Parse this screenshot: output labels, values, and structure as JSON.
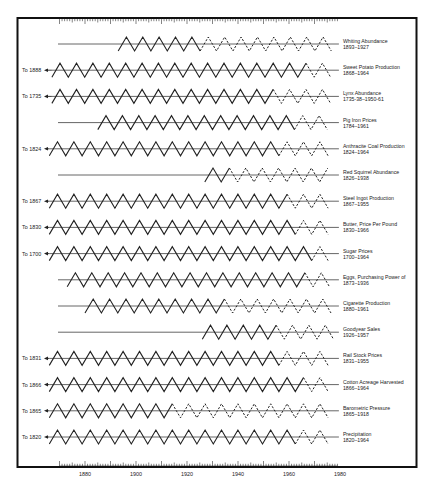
{
  "chart_data": {
    "type": "line",
    "title": "",
    "xlabel": "",
    "ylabel": "",
    "xlim": [
      1860,
      1985
    ],
    "x_ticks": [
      1880,
      1900,
      1920,
      1940,
      1960,
      1980
    ],
    "grid": false,
    "legend": "none",
    "series": [
      {
        "name": "Whiting Abundance",
        "range": "1893–1927",
        "to_label": "",
        "start_year": 1878,
        "zig_start_year": 1893,
        "dash_start_year": 1927,
        "end_year": 1978
      },
      {
        "name": "Sweet Potato Production",
        "range": "1868–1964",
        "to_label": "To 1888",
        "start_year": 1867,
        "zig_start_year": 1867,
        "dash_start_year": 1967,
        "end_year": 1978
      },
      {
        "name": "Lynx Abundance",
        "range": "1735-38–1950-61",
        "to_label": "To 1735",
        "start_year": 1867,
        "zig_start_year": 1867,
        "dash_start_year": 1957,
        "end_year": 1978
      },
      {
        "name": "Pig Iron Prices",
        "range": "1784–1961",
        "to_label": "",
        "start_year": 1878,
        "zig_start_year": 1885,
        "dash_start_year": 1965,
        "end_year": 1978
      },
      {
        "name": "Anthracite Coal Production",
        "range": "1824–1964",
        "to_label": "To 1824",
        "start_year": 1866,
        "zig_start_year": 1866,
        "dash_start_year": 1957,
        "end_year": 1978
      },
      {
        "name": "Red Squirrel Abundance",
        "range": "1826–1938",
        "to_label": "",
        "start_year": 1878,
        "zig_start_year": 1927,
        "dash_start_year": 1938,
        "end_year": 1978
      },
      {
        "name": "Steel Ingot Production",
        "range": "1867–1955",
        "to_label": "To 1867",
        "start_year": 1866,
        "zig_start_year": 1866,
        "dash_start_year": 1961,
        "end_year": 1978
      },
      {
        "name": "Butter, Price Per Pound",
        "range": "1830–1966",
        "to_label": "To 1830",
        "start_year": 1866,
        "zig_start_year": 1866,
        "dash_start_year": 1965,
        "end_year": 1978
      },
      {
        "name": "Sugar Prices",
        "range": "1700–1964",
        "to_label": "To 1700",
        "start_year": 1866,
        "zig_start_year": 1866,
        "dash_start_year": 1969,
        "end_year": 1978
      },
      {
        "name": "Eggs, Purchasing Power of",
        "range": "1873–1936",
        "to_label": "",
        "start_year": 1878,
        "zig_start_year": 1873,
        "dash_start_year": 1967,
        "end_year": 1978
      },
      {
        "name": "Cigarette Production",
        "range": "1880–1961",
        "to_label": "",
        "start_year": 1878,
        "zig_start_year": 1880,
        "dash_start_year": 1937,
        "end_year": 1978
      },
      {
        "name": "Goodyear Sales",
        "range": "1926–1957",
        "to_label": "",
        "start_year": 1878,
        "zig_start_year": 1926,
        "dash_start_year": 1958,
        "end_year": 1978
      },
      {
        "name": "Rail Stock Prices",
        "range": "1831–1955",
        "to_label": "To 1831",
        "start_year": 1866,
        "zig_start_year": 1866,
        "dash_start_year": 1957,
        "end_year": 1978
      },
      {
        "name": "Cotton Acreage Harvested",
        "range": "1866–1964",
        "to_label": "To 1866",
        "start_year": 1866,
        "zig_start_year": 1866,
        "dash_start_year": 1967,
        "end_year": 1978
      },
      {
        "name": "Barometric Pressure",
        "range": "1865–1918",
        "to_label": "To 1865",
        "start_year": 1866,
        "zig_start_year": 1866,
        "dash_start_year": 1917,
        "end_year": 1978
      },
      {
        "name": "Precipitation",
        "range": "1820–1964",
        "to_label": "To 1820",
        "start_year": 1866,
        "zig_start_year": 1866,
        "dash_start_year": 1965,
        "end_year": 1978
      }
    ]
  },
  "axis": {
    "ticks": [
      {
        "year": 1880,
        "label": "1880"
      },
      {
        "year": 1900,
        "label": "1900"
      },
      {
        "year": 1920,
        "label": "1920"
      },
      {
        "year": 1940,
        "label": "1940"
      },
      {
        "year": 1960,
        "label": "1960"
      },
      {
        "year": 1980,
        "label": "1980"
      }
    ]
  }
}
